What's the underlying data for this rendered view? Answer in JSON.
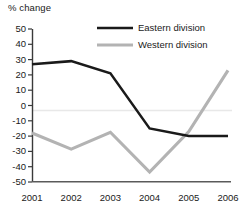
{
  "chart_data": {
    "type": "line",
    "title": "",
    "ylabel": "% change",
    "xlabel": "",
    "categories": [
      "2001",
      "2002",
      "2003",
      "2004",
      "2005",
      "2006"
    ],
    "ylim": [
      -50,
      50
    ],
    "y_ticks": [
      "50",
      "40",
      "30",
      "20",
      "10",
      "0",
      "-10",
      "-20",
      "-30",
      "-40",
      "-50"
    ],
    "grid": "zero-line-only",
    "legend_position": "top-right-inside",
    "series": [
      {
        "name": "Eastern division",
        "color": "#1a1a1a",
        "values": [
          27,
          29,
          21,
          -15,
          -20,
          -20
        ]
      },
      {
        "name": "Western division",
        "color": "#b3b3b3",
        "values": [
          -18,
          -28.5,
          -17.5,
          -43.5,
          -17,
          23
        ]
      }
    ]
  },
  "axis": {
    "y_title": "% change"
  },
  "legend": {
    "items": [
      {
        "label": "Eastern division"
      },
      {
        "label": "Western division"
      }
    ]
  }
}
